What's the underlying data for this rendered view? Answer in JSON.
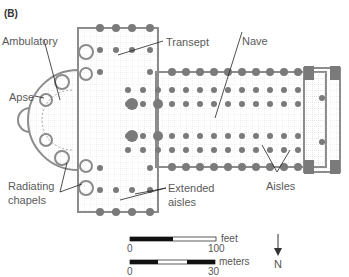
{
  "panel_label": "(B)",
  "labels": {
    "ambulatory": "Ambulatory",
    "apse": "Apse",
    "transept": "Transept",
    "nave": "Nave",
    "radiating_chapels_1": "Radiating",
    "radiating_chapels_2": "chapels",
    "extended_aisles_1": "Extended",
    "extended_aisles_2": "aisles",
    "aisles": "Aisles"
  },
  "scale": {
    "feet_unit": "feet",
    "feet_start": "0",
    "feet_end": "100",
    "meters_unit": "meters",
    "meters_start": "0",
    "meters_end": "30"
  },
  "north": "N",
  "colors": {
    "pier": "#7a7a7a",
    "wall": "#8c8c8c",
    "grid": "#c8c8c8",
    "text": "#5a5a5a"
  }
}
